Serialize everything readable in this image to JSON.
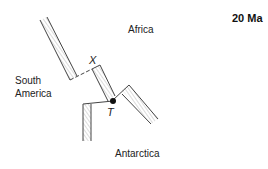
{
  "title": "20 Ma",
  "plates": {
    "africa": "Africa",
    "south_america_line1": "South",
    "south_america_line2": "America",
    "antarctica": "Antarctica"
  },
  "points": {
    "x_label": "X",
    "t_label": "T"
  },
  "colors": {
    "line": "#444444",
    "hatch": "#9a9a9a",
    "dot": "#111111",
    "background": "#ffffff"
  }
}
